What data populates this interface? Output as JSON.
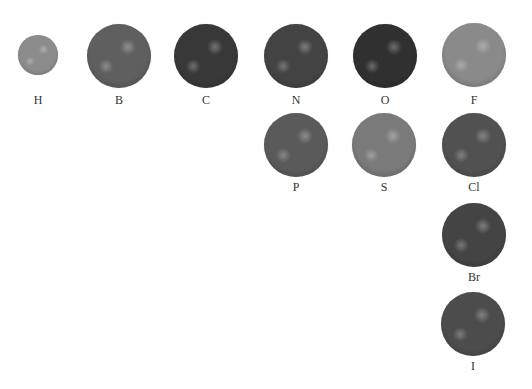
{
  "atoms": [
    {
      "symbol": "H",
      "cx": 38,
      "cy": 55,
      "r": 20,
      "color": "#8c8c8c",
      "label_y": 100
    },
    {
      "symbol": "B",
      "cx": 119,
      "cy": 56,
      "r": 32,
      "color": "#5f5f5f",
      "label_y": 100
    },
    {
      "symbol": "C",
      "cx": 206,
      "cy": 56,
      "r": 32,
      "color": "#383838",
      "label_y": 100
    },
    {
      "symbol": "N",
      "cx": 296,
      "cy": 56,
      "r": 32,
      "color": "#434343",
      "label_y": 100
    },
    {
      "symbol": "O",
      "cx": 385,
      "cy": 56,
      "r": 32,
      "color": "#303030",
      "label_y": 100
    },
    {
      "symbol": "F",
      "cx": 474,
      "cy": 55,
      "r": 32,
      "color": "#8a8a8a",
      "label_y": 100
    },
    {
      "symbol": "P",
      "cx": 296,
      "cy": 145,
      "r": 32,
      "color": "#5a5a5a",
      "label_y": 187
    },
    {
      "symbol": "S",
      "cx": 384,
      "cy": 145,
      "r": 32,
      "color": "#7a7a7a",
      "label_y": 187
    },
    {
      "symbol": "Cl",
      "cx": 474,
      "cy": 145,
      "r": 32,
      "color": "#515151",
      "label_y": 187
    },
    {
      "symbol": "Br",
      "cx": 474,
      "cy": 235,
      "r": 32,
      "color": "#444444",
      "label_y": 277
    },
    {
      "symbol": "I",
      "cx": 473,
      "cy": 324,
      "r": 32,
      "color": "#4c4c4c",
      "label_y": 366
    }
  ]
}
